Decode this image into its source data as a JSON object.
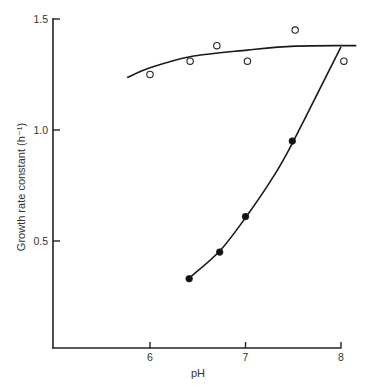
{
  "chart_data": {
    "type": "scatter",
    "title": "",
    "xlabel": "pH",
    "ylabel": "Growth rate constant (h⁻¹)",
    "xlim": [
      5.0,
      8.0
    ],
    "ylim": [
      0.0,
      1.5
    ],
    "x_ticks": [
      6,
      7,
      8
    ],
    "x_tick_labels": [
      "6",
      "7",
      "8"
    ],
    "y_ticks": [
      0.5,
      1.0,
      1.5
    ],
    "y_tick_labels": [
      "0.5",
      "1.0",
      "1.5"
    ],
    "grid": false,
    "legend": null,
    "series": [
      {
        "name": "open circles",
        "marker": "open-circle",
        "x": [
          6.0,
          6.42,
          6.7,
          7.02,
          7.52,
          8.03
        ],
        "y": [
          1.25,
          1.31,
          1.38,
          1.31,
          1.45,
          1.31
        ],
        "fit_curve": {
          "x": [
            5.76,
            6.0,
            6.42,
            7.02,
            7.52,
            8.16
          ],
          "y": [
            1.236,
            1.28,
            1.33,
            1.36,
            1.378,
            1.38
          ]
        }
      },
      {
        "name": "filled circles",
        "marker": "filled-circle",
        "x": [
          6.41,
          6.73,
          7.0,
          7.49
        ],
        "y": [
          0.33,
          0.45,
          0.61,
          0.95
        ],
        "fit_curve": {
          "x": [
            6.41,
            6.73,
            7.0,
            7.27,
            7.49,
            8.0
          ],
          "y": [
            0.333,
            0.455,
            0.605,
            0.775,
            0.94,
            1.375
          ]
        }
      }
    ]
  }
}
